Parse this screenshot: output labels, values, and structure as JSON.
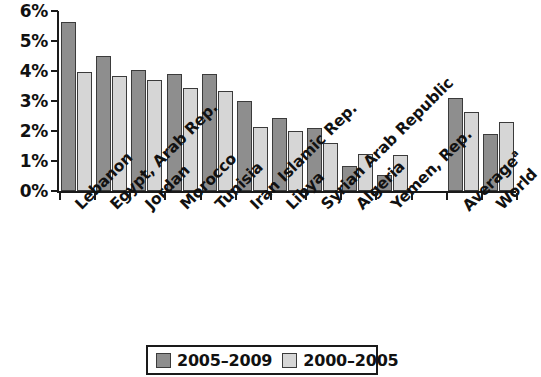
{
  "chart_data": {
    "type": "bar",
    "title": "",
    "subtitle": "",
    "xlabel": "",
    "ylabel": "",
    "ylim": [
      0,
      6
    ],
    "ytick_labels": [
      "0%",
      "1%",
      "2%",
      "3%",
      "4%",
      "5%",
      "6%"
    ],
    "ytick_values": [
      0,
      1,
      2,
      3,
      4,
      5,
      6
    ],
    "grid": false,
    "legend_position": "bottom-center",
    "categories": [
      "Lebanon",
      "Egypt, Arab Rep.",
      "Jordan",
      "Morocco",
      "Tunisia",
      "Iran Islamic Rep.",
      "Libya",
      "Syrian Arab Republic",
      "Algeria",
      "Yemen, Rep.",
      "",
      "Average",
      "World"
    ],
    "category_superscripts": [
      "",
      "",
      "",
      "",
      "",
      "",
      "",
      "",
      "",
      "",
      "",
      "a",
      ""
    ],
    "series": [
      {
        "name": "2005–2009",
        "color": "#8e8e8e",
        "values": [
          5.65,
          4.5,
          4.05,
          3.9,
          3.9,
          3.0,
          2.45,
          2.1,
          0.85,
          0.55,
          null,
          3.1,
          1.9
        ]
      },
      {
        "name": "2000–2005",
        "color": "#d6d6d6",
        "values": [
          3.98,
          3.85,
          3.7,
          3.45,
          3.35,
          2.15,
          2.0,
          1.6,
          1.25,
          1.2,
          null,
          2.65,
          2.3
        ]
      }
    ],
    "annotations": []
  },
  "legend": {
    "items": [
      {
        "label": "2005–2009",
        "swatch": "dark-gray-swatch"
      },
      {
        "label": "2000–2005",
        "swatch": "light-gray-swatch"
      }
    ]
  }
}
